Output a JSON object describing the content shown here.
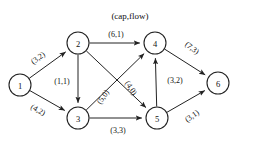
{
  "figure": {
    "title": "(cap,flow)",
    "caption": "",
    "background_color": "#ffffff",
    "ink_color": "#222222"
  },
  "graph_data": {
    "type": "directed-graph",
    "description": "Flow network with edge labels in (capacity, flow) form",
    "nodes": [
      {
        "id": "1",
        "label": "1",
        "x": 20,
        "y": 85
      },
      {
        "id": "2",
        "label": "2",
        "x": 78,
        "y": 43
      },
      {
        "id": "3",
        "label": "3",
        "x": 78,
        "y": 118
      },
      {
        "id": "4",
        "label": "4",
        "x": 155,
        "y": 43
      },
      {
        "id": "5",
        "label": "5",
        "x": 157,
        "y": 118
      },
      {
        "id": "6",
        "label": "6",
        "x": 218,
        "y": 83
      }
    ],
    "node_radius": 11,
    "edges": [
      {
        "from": "1",
        "to": "2",
        "capacity": 3,
        "flow": 2,
        "label": "(3,2)",
        "label_x": 38,
        "label_y": 58,
        "label_rotation": -36
      },
      {
        "from": "1",
        "to": "3",
        "capacity": 4,
        "flow": 2,
        "label": "(4,2)",
        "label_x": 38,
        "label_y": 110,
        "label_rotation": 29
      },
      {
        "from": "2",
        "to": "3",
        "capacity": 1,
        "flow": 1,
        "label": "(1,1)",
        "label_x": 62,
        "label_y": 81,
        "label_rotation": 0
      },
      {
        "from": "2",
        "to": "4",
        "capacity": 6,
        "flow": 1,
        "label": "(6,1)",
        "label_x": 116,
        "label_y": 34,
        "label_rotation": 0
      },
      {
        "from": "2",
        "to": "5",
        "capacity": 4,
        "flow": 0,
        "label": "(4,0)",
        "label_x": 131,
        "label_y": 88,
        "label_rotation": 57
      },
      {
        "from": "3",
        "to": "4",
        "capacity": 5,
        "flow": 0,
        "label": "(5,0)",
        "label_x": 103,
        "label_y": 97,
        "label_rotation": -56
      },
      {
        "from": "3",
        "to": "5",
        "capacity": 3,
        "flow": 3,
        "label": "(3,3)",
        "label_x": 118,
        "label_y": 130,
        "label_rotation": 0
      },
      {
        "from": "5",
        "to": "4",
        "capacity": 3,
        "flow": 2,
        "label": "(3,2)",
        "label_x": 175,
        "label_y": 80,
        "label_rotation": 0
      },
      {
        "from": "4",
        "to": "6",
        "capacity": 7,
        "flow": 3,
        "label": "(7,3)",
        "label_x": 192,
        "label_y": 48,
        "label_rotation": 38
      },
      {
        "from": "5",
        "to": "6",
        "capacity": 3,
        "flow": 1,
        "label": "(3,1)",
        "label_x": 192,
        "label_y": 116,
        "label_rotation": -35
      }
    ]
  }
}
